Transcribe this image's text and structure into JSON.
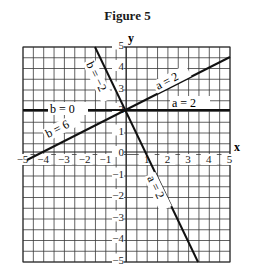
{
  "figure": {
    "title": "Figure 5",
    "x_axis_label": "x",
    "y_axis_label": "y",
    "x_ticks": [
      "-5",
      "-4",
      "-3",
      "-2",
      "-1",
      "1",
      "2",
      "3",
      "4",
      "5"
    ],
    "y_ticks": [
      "5",
      "4",
      "3",
      "2",
      "1",
      "0",
      "-1",
      "-2",
      "-3",
      "-4",
      "-5"
    ],
    "line_labels": {
      "b_neg2": "b = −2",
      "b_0": "b = 0",
      "b_6": "b = 6",
      "a_2_up": "a = 2",
      "a_2_flat": "a = 2",
      "a_2_down": "a = 2"
    }
  },
  "chart_data": {
    "type": "line",
    "title": "Figure 5",
    "xlabel": "x",
    "ylabel": "y",
    "xlim": [
      -5,
      5
    ],
    "ylim": [
      -5,
      5
    ],
    "grid": true,
    "grid_step": 0.5,
    "series": [
      {
        "name": "b = 0 / a = 2 (horizontal)",
        "equation": "y = 2",
        "points": [
          [
            -5,
            2
          ],
          [
            5,
            2
          ]
        ]
      },
      {
        "name": "b = 6 / a = 2 (rising)",
        "equation": "y = 0.5x + 2",
        "points": [
          [
            -4.8,
            -0.4
          ],
          [
            5,
            4.5
          ]
        ]
      },
      {
        "name": "b = -2 / a = 2 (falling)",
        "equation": "y = -2x + 2",
        "points": [
          [
            -1.5,
            5
          ],
          [
            3.5,
            -5
          ]
        ]
      }
    ],
    "annotations": [
      "b = −2",
      "b = 0",
      "b = 6",
      "a = 2",
      "a = 2",
      "a = 2"
    ]
  }
}
